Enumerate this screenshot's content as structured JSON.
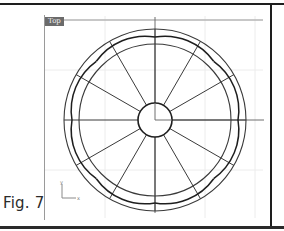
{
  "figure": {
    "caption": "Fig. 7"
  },
  "viewport": {
    "label": "Top",
    "axis_icon": {
      "y_label": "y",
      "x_label": "x"
    }
  },
  "colors": {
    "frame": "#1e1e1e",
    "grid": "#e8e8e8",
    "axis": "#6f6f6f",
    "curve": "#2a2a2a",
    "label_bg": "#6b6b6b"
  },
  "geometry": {
    "center": [
      155,
      120
    ],
    "outer_circle_radius": 91,
    "inner_circle_radius": 76,
    "hub_circle_radius": 17,
    "radial_spokes": 12,
    "scallop_arcs": 8
  }
}
